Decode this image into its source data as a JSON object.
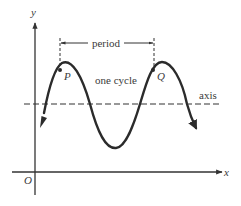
{
  "figure": {
    "type": "sinusoid-diagram",
    "labels": {
      "y_axis": "y",
      "x_axis": "x",
      "origin": "O",
      "point_p": "P",
      "point_q": "Q",
      "period": "period",
      "one_cycle": "one cycle",
      "axis": "axis"
    },
    "colors": {
      "curve": "#2b2b2b",
      "axes": "#333333",
      "dashed": "#333333",
      "text": "#3a3a3a",
      "background": "#ffffff"
    },
    "elements": {
      "coordinate_axes": true,
      "sine_wave_with_arrow_ends": true,
      "dashed_midline": true,
      "period_bracket": true,
      "marked_points": [
        "P",
        "Q"
      ]
    }
  }
}
